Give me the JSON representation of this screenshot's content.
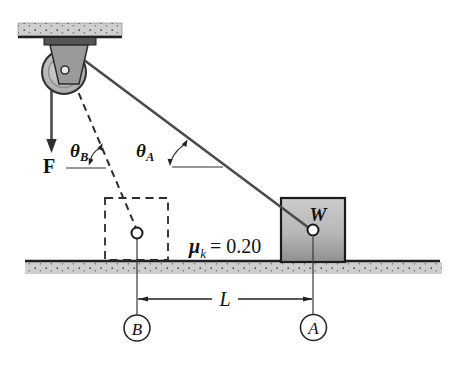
{
  "diagram": {
    "force_label": "F",
    "angle_b": {
      "symbol": "θ",
      "subscript": "B"
    },
    "angle_a": {
      "symbol": "θ",
      "subscript": "A"
    },
    "friction": {
      "symbol": "μ",
      "subscript": "k",
      "value": "= 0.20"
    },
    "block_label": "W",
    "distance_label": "L",
    "point_b": "B",
    "point_a": "A",
    "colors": {
      "outline": "#1f1f1f",
      "rope": "#4a4a4a",
      "dashed_line": "#2b2b2b",
      "surface_fill": "#cfcfcf",
      "speckle": "#4a4a4a",
      "block_top": "#cccccc",
      "block_bottom": "#8f8f8f",
      "bracket_fill": "#9a9a9a",
      "plate_fill": "#555555",
      "wheel_inner": "#d8d8d8",
      "wheel_outer": "#9e9e9e"
    }
  }
}
